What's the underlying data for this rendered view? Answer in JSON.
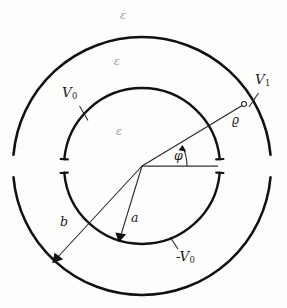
{
  "figure": {
    "colors": {
      "stroke": "#111111",
      "thin_stroke": "#222222",
      "epsilon_text": "#9a9a97",
      "background": "#fdfdfc"
    },
    "geometry": {
      "center_x": 142,
      "center_y": 166,
      "outer_radius": 129,
      "inner_radius": 78,
      "outer_line_width": 2.6,
      "inner_line_width": 2.4,
      "gap_half_angle_deg": 5,
      "rho_point_x": 244,
      "rho_point_y": 104,
      "phi_angle_deg": 26
    },
    "labels": {
      "epsilon_outside": "ε",
      "epsilon_annulus": "ε",
      "epsilon_core": "ε",
      "outer_potential": "V",
      "outer_potential_sub": "1",
      "inner_top_potential": "V",
      "inner_top_potential_sub": "0",
      "inner_bottom_potential": "-V",
      "inner_bottom_potential_sub": "0",
      "inner_radius_label": "a",
      "outer_radius_label": "b",
      "field_point_label": "ϱ",
      "angle_label": "φ"
    }
  }
}
